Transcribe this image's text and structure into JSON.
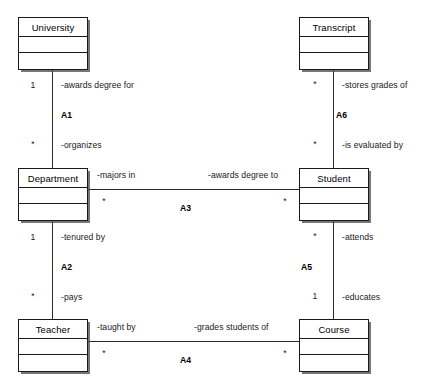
{
  "diagram": {
    "type": "uml-class-diagram",
    "classes": [
      {
        "id": "university",
        "name": "University"
      },
      {
        "id": "transcript",
        "name": "Transcript"
      },
      {
        "id": "department",
        "name": "Department"
      },
      {
        "id": "student",
        "name": "Student"
      },
      {
        "id": "teacher",
        "name": "Teacher"
      },
      {
        "id": "course",
        "name": "Course"
      }
    ],
    "associations": [
      {
        "id": "A1",
        "name": "A1",
        "orientation": "vertical",
        "from": "University",
        "to": "Department",
        "from_role": "-awards degree for",
        "from_multiplicity": "1",
        "to_role": "-organizes",
        "to_multiplicity": "*"
      },
      {
        "id": "A2",
        "name": "A2",
        "orientation": "vertical",
        "from": "Department",
        "to": "Teacher",
        "from_role": "-tenured by",
        "from_multiplicity": "1",
        "to_role": "-pays",
        "to_multiplicity": "*"
      },
      {
        "id": "A3",
        "name": "A3",
        "orientation": "horizontal",
        "from": "Department",
        "to": "Student",
        "from_role": "-majors in",
        "from_multiplicity": "*",
        "to_role": "-awards degree to",
        "to_multiplicity": "*"
      },
      {
        "id": "A4",
        "name": "A4",
        "orientation": "horizontal",
        "from": "Teacher",
        "to": "Course",
        "from_role": "-taught by",
        "from_multiplicity": "*",
        "to_role": "-grades students of",
        "to_multiplicity": "*"
      },
      {
        "id": "A5",
        "name": "A5",
        "orientation": "vertical",
        "from": "Student",
        "to": "Course",
        "from_role": "-educates",
        "from_multiplicity": "*",
        "to_role": "-attends",
        "to_multiplicity": "1"
      },
      {
        "id": "A6",
        "name": "A6",
        "orientation": "vertical",
        "from": "Transcript",
        "to": "Student",
        "from_role": "-stores grades of",
        "from_multiplicity": "*",
        "to_role": "-is evaluated by",
        "to_multiplicity": "*"
      }
    ],
    "colors": {
      "background": "#ffffff",
      "box_border": "#1a1a1a",
      "box_fill": "#ffffff",
      "line": "#2b2b2b",
      "text": "#1a1a1a"
    }
  }
}
